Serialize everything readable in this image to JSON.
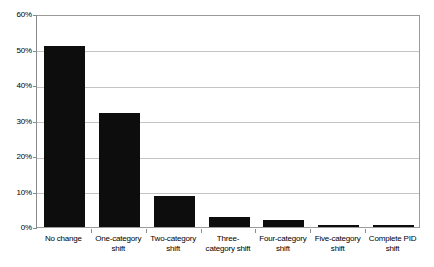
{
  "chart_data": {
    "type": "bar",
    "title": "",
    "subtitle": "",
    "xlabel": "",
    "ylabel": "",
    "ylim": [
      0,
      60
    ],
    "y_tick_labels": [
      "0%",
      "10%",
      "20%",
      "30%",
      "40%",
      "50%",
      "60%"
    ],
    "y_tick_values": [
      0,
      10,
      20,
      30,
      40,
      50,
      60
    ],
    "grid": true,
    "legend": false,
    "legend_position": "none",
    "bar_color": "#0d0d0d",
    "gridline_color": "#c4c4c4",
    "axis_color": "#8a8a8a",
    "plot_border_color": "#9a9a9a",
    "background_color": "#ffffff",
    "categories": [
      "No change",
      "One-category shift",
      "Two-category shift",
      "Three-category shift",
      "Four-category shift",
      "Five-category shift",
      "Complete PID shift"
    ],
    "category_lines": [
      [
        "No change"
      ],
      [
        "One-category",
        "shift"
      ],
      [
        "Two-category",
        "shift"
      ],
      [
        "Three-",
        "category shift"
      ],
      [
        "Four-category",
        "shift"
      ],
      [
        "Five-category",
        "shift"
      ],
      [
        "Complete PID",
        "shift"
      ]
    ],
    "values": [
      51,
      32,
      8.7,
      2.8,
      2.1,
      0.6,
      0.5
    ],
    "units": "percent"
  }
}
